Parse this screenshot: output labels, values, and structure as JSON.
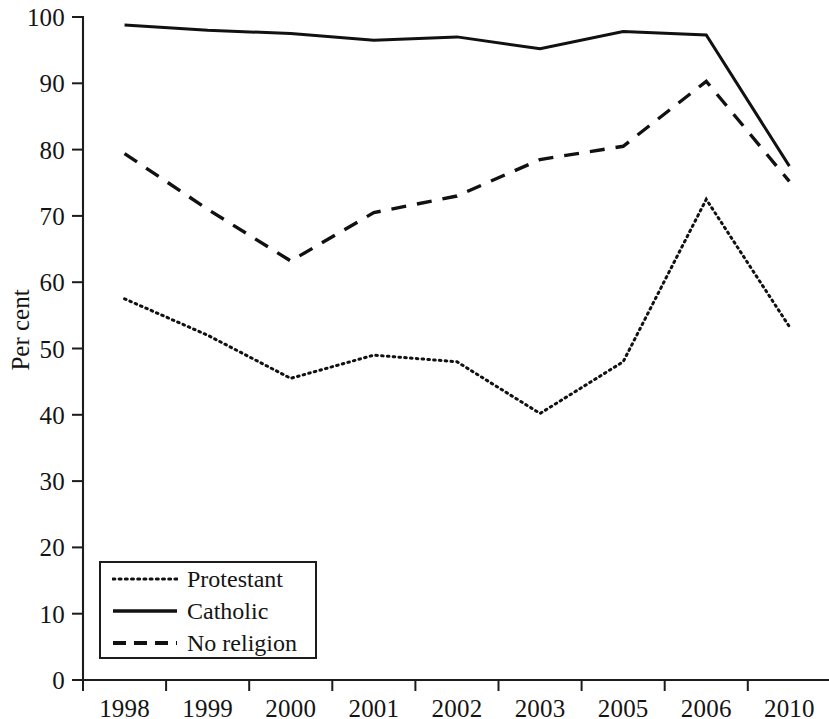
{
  "chart_data": {
    "type": "line",
    "title": "",
    "xlabel": "",
    "ylabel": "Per cent",
    "categories": [
      "1998",
      "1999",
      "2000",
      "2001",
      "2002",
      "2003",
      "2005",
      "2006",
      "2010"
    ],
    "ylim": [
      0,
      100
    ],
    "ytick_values": [
      0,
      10,
      20,
      30,
      40,
      50,
      60,
      70,
      80,
      90,
      100
    ],
    "ytick_labels": [
      "0",
      "10",
      "20",
      "30",
      "40",
      "50",
      "60",
      "70",
      "80",
      "90",
      "100"
    ],
    "grid": false,
    "legend_position": "lower-left-inside",
    "series": [
      {
        "name": "Protestant",
        "style": "dotted",
        "color": "#111111",
        "values": [
          57.5,
          52.0,
          45.5,
          49.0,
          48.0,
          40.2,
          48.0,
          72.5,
          53.3
        ]
      },
      {
        "name": "Catholic",
        "style": "solid",
        "color": "#111111",
        "values": [
          98.8,
          98.0,
          97.5,
          96.5,
          97.0,
          95.2,
          97.8,
          97.3,
          77.5
        ]
      },
      {
        "name": "No religion",
        "style": "dashed",
        "color": "#111111",
        "values": [
          79.4,
          71.0,
          63.2,
          70.5,
          73.0,
          78.5,
          80.5,
          90.3,
          75.2
        ]
      }
    ]
  },
  "axis": {
    "ylabel": "Per cent"
  },
  "legend": {
    "entries": [
      {
        "label": "Protestant",
        "style": "dotted"
      },
      {
        "label": "Catholic",
        "style": "solid"
      },
      {
        "label": "No religion",
        "style": "dashed"
      }
    ]
  }
}
